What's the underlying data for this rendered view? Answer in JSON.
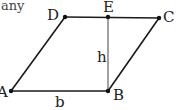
{
  "caption_fragment": "any",
  "diagram": {
    "points": {
      "A": {
        "label": "A",
        "x": 11,
        "y": 91
      },
      "B": {
        "label": "B",
        "x": 108,
        "y": 91
      },
      "C": {
        "label": "C",
        "x": 159,
        "y": 18
      },
      "D": {
        "label": "D",
        "x": 65,
        "y": 17
      },
      "E": {
        "label": "E",
        "x": 108,
        "y": 17
      }
    },
    "segments": [
      {
        "from": "A",
        "to": "B"
      },
      {
        "from": "B",
        "to": "C"
      },
      {
        "from": "C",
        "to": "D"
      },
      {
        "from": "D",
        "to": "A"
      },
      {
        "from": "E",
        "to": "B"
      }
    ],
    "measure_labels": {
      "base": "b",
      "height": "h"
    },
    "stroke_color": "#1a1a1a",
    "height_stroke_color": "#555555"
  }
}
